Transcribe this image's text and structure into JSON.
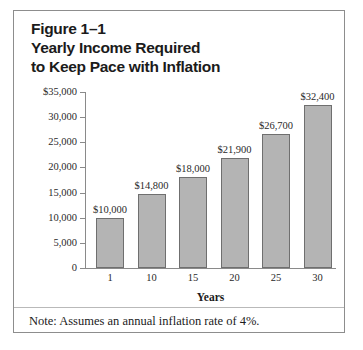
{
  "figure": {
    "title_lines": [
      "Figure 1–1",
      "Yearly Income Required",
      "to Keep Pace with Inflation"
    ],
    "note": "Note: Assumes an annual inflation rate of 4%."
  },
  "colors": {
    "bar_fill": "#b4b4b4",
    "bar_stroke": "#6f6f6f",
    "axis": "#8a8a8a",
    "border": "#8d8d8d",
    "text": "#1b1b1b",
    "background": "#ffffff"
  },
  "chart_data": {
    "type": "bar",
    "title": "Yearly Income Required to Keep Pace with Inflation",
    "subtitle": "Figure 1–1",
    "xlabel": "Years",
    "ylabel": "",
    "categories": [
      "1",
      "10",
      "15",
      "20",
      "25",
      "30"
    ],
    "values": [
      10000,
      14800,
      18000,
      21900,
      26700,
      32400
    ],
    "data_labels": [
      "$10,000",
      "$14,800",
      "$18,000",
      "$21,900",
      "$26,700",
      "$32,400"
    ],
    "ylim": [
      0,
      35000
    ],
    "ytick_values": [
      35000,
      30000,
      25000,
      20000,
      15000,
      10000,
      5000,
      0
    ],
    "ytick_labels": [
      "$35,000",
      "30,000",
      "25,000",
      "20,000",
      "15,000",
      "10,000",
      "5,000",
      "0"
    ],
    "grid": false,
    "legend": null,
    "annotations": [
      "Note: Assumes an annual inflation rate of 4%."
    ]
  }
}
